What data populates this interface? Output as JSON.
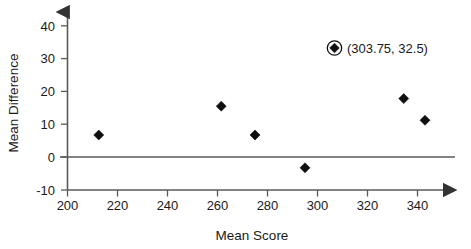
{
  "chart_data": {
    "type": "scatter",
    "title": "",
    "xlabel": "Mean Score",
    "ylabel": "Mean Difference",
    "xlim": [
      200,
      355
    ],
    "ylim": [
      -10,
      44
    ],
    "xticks": [
      200,
      220,
      240,
      260,
      280,
      300,
      320,
      340
    ],
    "yticks": [
      -10,
      0,
      10,
      20,
      30,
      40
    ],
    "xtick_labels": [
      "200",
      "220",
      "240",
      "260",
      "280",
      "300",
      "320",
      "340"
    ],
    "ytick_labels": [
      "-10",
      "0",
      "10",
      "20",
      "30",
      "40"
    ],
    "grid": false,
    "legend_position": "inside-top-right",
    "reference_line": {
      "y": 0,
      "color": "#5a5a5a"
    },
    "marker_shape": "diamond",
    "marker_color": "#101010",
    "points": [
      {
        "x": 212.5,
        "y": 6.7
      },
      {
        "x": 261.5,
        "y": 15.5
      },
      {
        "x": 275.0,
        "y": 6.7
      },
      {
        "x": 295.0,
        "y": -3.3
      },
      {
        "x": 334.5,
        "y": 17.8
      },
      {
        "x": 343.0,
        "y": 11.2
      }
    ],
    "annotations": [
      {
        "label": "(303.75, 32.5)",
        "x": 303.75,
        "y": 32.5,
        "highlighted": true,
        "marker": "circled-diamond"
      }
    ]
  },
  "axes": {
    "x_arrow": true,
    "y_arrow": true,
    "line_color": "#5a5a5a"
  }
}
